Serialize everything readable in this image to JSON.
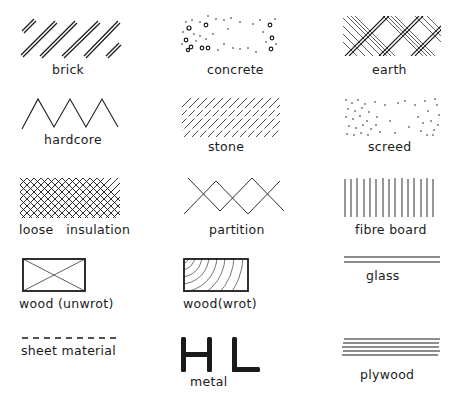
{
  "diagram": {
    "ink_color": "#1a1a1a",
    "background": "#ffffff",
    "symbols": [
      {
        "id": "brick",
        "label": "brick",
        "pattern": "paired diagonal lines"
      },
      {
        "id": "concrete",
        "label": "concrete",
        "pattern": "dots and small aggregate circles"
      },
      {
        "id": "earth",
        "label": "earth",
        "pattern": "diagonal double lines with cross hatching"
      },
      {
        "id": "hardcore",
        "label": "hardcore",
        "pattern": "zigzag"
      },
      {
        "id": "stone",
        "label": "stone",
        "pattern": "broken diagonal lines"
      },
      {
        "id": "screed",
        "label": "screed",
        "pattern": "fine stipple dots"
      },
      {
        "id": "loose-insulation",
        "label": "loose   insulation",
        "pattern": "diagonal cross hatch"
      },
      {
        "id": "partition",
        "label": "partition",
        "pattern": "crossing zigzag lines"
      },
      {
        "id": "fibre-board",
        "label": "fibre board",
        "pattern": "vertical lines"
      },
      {
        "id": "wood-unwrot",
        "label": "wood (unwrot)",
        "pattern": "rectangle with diagonal cross"
      },
      {
        "id": "wood-wrot",
        "label": "wood(wrot)",
        "pattern": "rectangle with end grain arcs"
      },
      {
        "id": "glass",
        "label": "glass",
        "pattern": "two parallel horizontal lines"
      },
      {
        "id": "sheet-material",
        "label": "sheet material",
        "pattern": "dashed line"
      },
      {
        "id": "metal",
        "label": "metal",
        "pattern": "H and L sections"
      },
      {
        "id": "plywood",
        "label": "plywood",
        "pattern": "multiple parallel horizontal lines"
      }
    ]
  }
}
